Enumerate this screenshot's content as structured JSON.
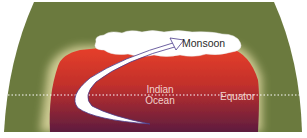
{
  "diagram": {
    "title": "",
    "labels": {
      "monsoon": "Monsoon",
      "ocean_line1": "Indian",
      "ocean_line2": "Ocean",
      "equator": "Equator"
    },
    "colors": {
      "land": "#6b7a3e",
      "warm_pool_top": "#e23a22",
      "warm_pool_bottom": "#6b2040",
      "cloud": "#ffffff",
      "arrow": "#ffffff",
      "equator_line": "#ffffff"
    },
    "elements": [
      "globe-section",
      "warm-ocean-region",
      "monsoon-cloud",
      "monsoon-wind-arrow",
      "equator-line"
    ]
  }
}
